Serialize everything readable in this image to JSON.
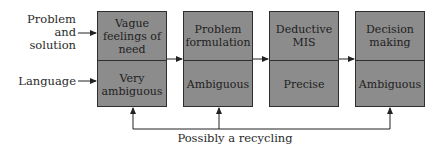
{
  "inputs": {
    "problem_solution": "Problem and solution",
    "problem_solution_line1": "Problem and",
    "problem_solution_line2": "solution",
    "language": "Language"
  },
  "stages": [
    {
      "top": "Vague feelings of need",
      "bottom": "Very ambiguous"
    },
    {
      "top": "Problem formulation",
      "bottom": "Ambiguous"
    },
    {
      "top": "Deductive MIS",
      "bottom": "Precise"
    },
    {
      "top": "Decision making",
      "bottom": "Ambiguous"
    }
  ],
  "feedback_label": "Possibly a recycling"
}
